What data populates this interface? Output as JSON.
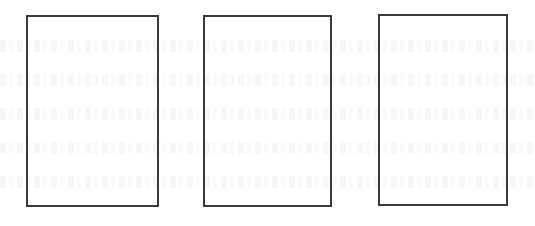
{
  "page": {
    "frames": [
      {
        "id": "frame-1",
        "left": 26,
        "top": 15,
        "width": 133,
        "height": 192
      },
      {
        "id": "frame-2",
        "left": 203,
        "top": 15,
        "width": 129,
        "height": 192
      },
      {
        "id": "frame-3",
        "left": 378,
        "top": 14,
        "width": 130,
        "height": 192
      }
    ],
    "colors": {
      "background": "#ffffff",
      "frame_stroke": "#3a3a3a"
    }
  }
}
